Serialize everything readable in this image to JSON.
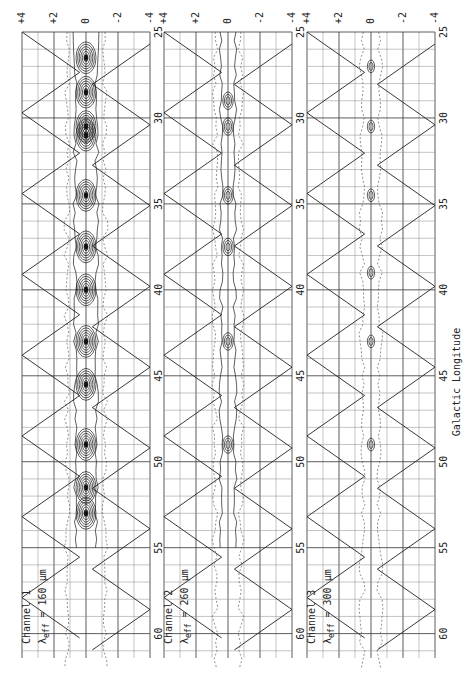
{
  "chart_data": {
    "type": "heatmap",
    "subtype": "contour-map",
    "orientation": "rotated-90 (longitude runs top-to-bottom, latitude left-to-right)",
    "title": "",
    "xlabel": "Galactic Longitude",
    "ylabel": "",
    "longitude_range": [
      25,
      62
    ],
    "latitude_range": [
      4,
      -4
    ],
    "longitude_ticks": [
      "25",
      "30",
      "35",
      "40",
      "45",
      "50",
      "55",
      "60"
    ],
    "latitude_ticks": [
      "+4",
      "+2",
      "0",
      "-2",
      "-4"
    ],
    "grid": true,
    "panels": [
      {
        "name": "Channel 1",
        "channel_label": "Channel 1",
        "wavelength_label": "λeff = 160 μm",
        "lambda_prefix": "λ",
        "lambda_sub": "eff",
        "lambda_value": "= 160 μm",
        "contour_density": "high",
        "sources_longitude": [
          26.5,
          28.5,
          30.5,
          31,
          34.5,
          37.5,
          40,
          43,
          45.5,
          49,
          51.5,
          53
        ]
      },
      {
        "name": "Channel 2",
        "channel_label": "Channel 2",
        "wavelength_label": "λeff = 260 μm",
        "lambda_prefix": "λ",
        "lambda_sub": "eff",
        "lambda_value": "= 260 μm",
        "contour_density": "medium",
        "sources_longitude": [
          29,
          30.5,
          34.5,
          37.5,
          43,
          49
        ]
      },
      {
        "name": "Channel 3",
        "channel_label": "Channel 3",
        "wavelength_label": "λeff = 300 μm",
        "lambda_prefix": "λ",
        "lambda_sub": "eff",
        "lambda_value": "= 300 μm",
        "contour_density": "low",
        "sources_longitude": [
          27,
          30.5,
          34.5,
          39,
          43,
          49
        ]
      }
    ]
  }
}
